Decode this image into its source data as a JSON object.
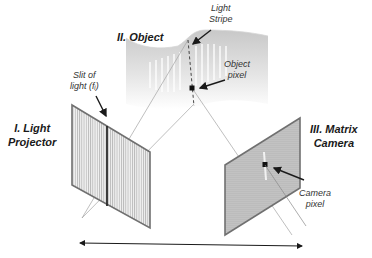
{
  "diagram": {
    "components": {
      "projector": {
        "label_line1": "I. Light",
        "label_line2": "Projector"
      },
      "object": {
        "label": "II. Object"
      },
      "camera": {
        "label_line1": "III. Matrix",
        "label_line2": "Camera"
      }
    },
    "annotations": {
      "slit": {
        "line1": "Slit of",
        "line2": "light (fᵢ)"
      },
      "light_stripe": {
        "line1": "Light",
        "line2": "Stripe"
      },
      "object_pixel": {
        "line1": "Object",
        "line2": "pixel"
      },
      "camera_pixel": {
        "line1": "Camera",
        "line2": "pixel"
      }
    },
    "colors": {
      "panel_border": "#6e6e6e",
      "panel_fill": "#e6e6e6",
      "ray": "#9a9a9a",
      "arrow": "#1a1a1a",
      "object_fill": "#dcdcdc"
    }
  }
}
